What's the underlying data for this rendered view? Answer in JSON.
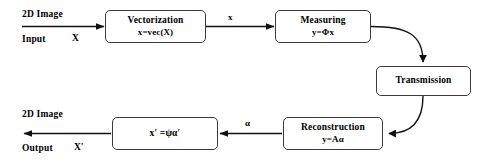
{
  "diagram": {
    "type": "flowchart",
    "background_color": "#ffffff",
    "stroke_color": "#3c3c3c",
    "text_color": "#000000",
    "nodes": [
      {
        "id": "vectorization",
        "title": "Vectorization",
        "formula": "x=vec(X)"
      },
      {
        "id": "measuring",
        "title": "Measuring",
        "formula": "y=Φx"
      },
      {
        "id": "transmission",
        "title": "Transmission",
        "formula": ""
      },
      {
        "id": "reconstruction",
        "title": "Reconstruction",
        "formula": "y=Aα"
      },
      {
        "id": "inverse",
        "title": "x′ =ψα′",
        "formula": ""
      }
    ],
    "endpoints": {
      "input_heading": "2D Image",
      "input_label": "Input",
      "input_symbol": "X",
      "output_heading": "2D Image",
      "output_label": "Output",
      "output_symbol": "X′"
    },
    "edge_labels": {
      "vectorization_to_measuring": "x",
      "reconstruction_to_inverse": "α"
    }
  }
}
